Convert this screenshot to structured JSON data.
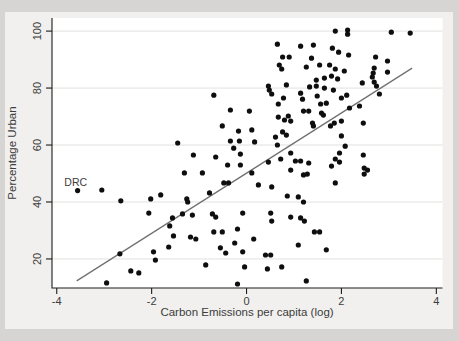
{
  "figure": {
    "outer_background": "#d6d5d3",
    "figure_background": "#f1f0ee",
    "plot_background": "#ffffff",
    "grid_color": "#e1e1df",
    "axis_color": "#1c1c1c",
    "text_color": "#3c3c3c",
    "dot_color": "#0e0e0e",
    "fit_line_color": "#6f6f6f"
  },
  "chart_data": {
    "type": "scatter",
    "title": "",
    "xlabel": "Carbon Emissions per capita (log)",
    "ylabel": "Percentage Urban",
    "xlim": [
      -4.1,
      4.13
    ],
    "ylim": [
      9.8,
      104.6
    ],
    "xticks": [
      "-4",
      "-2",
      "0",
      "2",
      "4"
    ],
    "xtick_values": [
      -4,
      -2,
      0,
      2,
      4
    ],
    "yticks": [
      "20",
      "40",
      "60",
      "80",
      "100"
    ],
    "ytick_values": [
      20,
      40,
      60,
      80,
      100
    ],
    "grid": "horizontal",
    "legend": "none",
    "annotation": {
      "label": "DRC",
      "x": -3.6,
      "y": 46.8
    },
    "fit_line": {
      "x1": -3.58,
      "y1": 12.3,
      "x2": 3.49,
      "y2": 87.0
    },
    "points": [
      [
        -1.45,
        60.7
      ],
      [
        0.65,
        95.4
      ],
      [
        1.14,
        94.7
      ],
      [
        0.76,
        90.9
      ],
      [
        0.9,
        90.9
      ],
      [
        0.74,
        86.7
      ],
      [
        1.26,
        87.4
      ],
      [
        1.41,
        95.1
      ],
      [
        0.69,
        88.1
      ],
      [
        1.37,
        90.5
      ],
      [
        0.46,
        80.7
      ],
      [
        0.48,
        79.3
      ],
      [
        0.53,
        77.9
      ],
      [
        0.84,
        81.1
      ],
      [
        -0.69,
        77.5
      ],
      [
        0.78,
        76.5
      ],
      [
        1.14,
        78.2
      ],
      [
        1.33,
        80.4
      ],
      [
        1.18,
        76.1
      ],
      [
        1.49,
        77.2
      ],
      [
        0.67,
        74.4
      ],
      [
        -0.34,
        72.3
      ],
      [
        0.06,
        71.9
      ],
      [
        0.67,
        69.8
      ],
      [
        0.88,
        70.2
      ],
      [
        0.93,
        68.4
      ],
      [
        1.31,
        71.9
      ],
      [
        1.2,
        71.9
      ],
      [
        1.39,
        67.7
      ],
      [
        1.41,
        66.7
      ],
      [
        0.8,
        68.8
      ],
      [
        -0.51,
        66.7
      ],
      [
        -0.17,
        64.9
      ],
      [
        0.11,
        65.3
      ],
      [
        -0.34,
        61.4
      ],
      [
        -0.15,
        61.4
      ],
      [
        0.17,
        61.1
      ],
      [
        0.61,
        62.8
      ],
      [
        0.84,
        63.5
      ],
      [
        0.76,
        64.6
      ],
      [
        0.65,
        60.0
      ],
      [
        -0.27,
        58.9
      ],
      [
        1.87,
        100.0
      ],
      [
        2.13,
        100.4
      ],
      [
        2.13,
        98.9
      ],
      [
        3.05,
        99.6
      ],
      [
        3.45,
        99.3
      ],
      [
        1.81,
        94.0
      ],
      [
        1.94,
        92.6
      ],
      [
        2.15,
        91.6
      ],
      [
        2.72,
        90.9
      ],
      [
        2.97,
        89.5
      ],
      [
        1.54,
        88.1
      ],
      [
        1.75,
        88.1
      ],
      [
        1.87,
        86.7
      ],
      [
        2.06,
        86.0
      ],
      [
        2.97,
        85.6
      ],
      [
        2.69,
        87.0
      ],
      [
        1.47,
        82.8
      ],
      [
        1.64,
        83.5
      ],
      [
        1.79,
        84.2
      ],
      [
        1.92,
        83.2
      ],
      [
        2.67,
        85.3
      ],
      [
        2.65,
        83.9
      ],
      [
        2.69,
        82.1
      ],
      [
        2.74,
        80.7
      ],
      [
        2.44,
        81.8
      ],
      [
        1.64,
        80.0
      ],
      [
        1.83,
        79.3
      ],
      [
        1.47,
        80.7
      ],
      [
        2.0,
        76.5
      ],
      [
        2.11,
        77.5
      ],
      [
        2.8,
        77.9
      ],
      [
        1.68,
        74.7
      ],
      [
        1.56,
        74.4
      ],
      [
        2.17,
        73.0
      ],
      [
        2.38,
        73.7
      ],
      [
        1.58,
        71.2
      ],
      [
        1.62,
        70.5
      ],
      [
        1.85,
        67.7
      ],
      [
        2.0,
        68.4
      ],
      [
        1.77,
        66.7
      ],
      [
        2.46,
        67.7
      ],
      [
        2.0,
        63.2
      ],
      [
        2.08,
        59.6
      ],
      [
        -3.56,
        44.0
      ],
      [
        -3.05,
        44.2
      ],
      [
        -2.65,
        40.4
      ],
      [
        -2.02,
        41.1
      ],
      [
        -1.81,
        42.5
      ],
      [
        -2.06,
        36.1
      ],
      [
        -1.56,
        34.4
      ],
      [
        -1.62,
        31.6
      ],
      [
        -1.54,
        28.1
      ],
      [
        -1.64,
        24.2
      ],
      [
        -1.96,
        22.5
      ],
      [
        -1.92,
        19.6
      ],
      [
        -2.67,
        21.8
      ],
      [
        -2.44,
        15.8
      ],
      [
        -2.27,
        15.1
      ],
      [
        -2.95,
        11.6
      ],
      [
        -1.12,
        56.5
      ],
      [
        -0.65,
        55.8
      ],
      [
        -0.13,
        56.8
      ],
      [
        0.93,
        57.2
      ],
      [
        0.46,
        54.0
      ],
      [
        0.72,
        55.1
      ],
      [
        1.03,
        54.4
      ],
      [
        1.14,
        54.4
      ],
      [
        1.31,
        53.7
      ],
      [
        -1.31,
        50.2
      ],
      [
        -0.93,
        50.2
      ],
      [
        -0.4,
        53.0
      ],
      [
        -0.13,
        53.0
      ],
      [
        0.11,
        50.2
      ],
      [
        0.93,
        51.2
      ],
      [
        1.2,
        49.5
      ],
      [
        1.28,
        49.8
      ],
      [
        -0.48,
        46.7
      ],
      [
        -0.38,
        46.7
      ],
      [
        0.25,
        46.0
      ],
      [
        0.53,
        45.3
      ],
      [
        0.86,
        42.1
      ],
      [
        1.09,
        41.8
      ],
      [
        1.2,
        40.0
      ],
      [
        -0.78,
        43.2
      ],
      [
        -1.26,
        41.1
      ],
      [
        -1.24,
        40.0
      ],
      [
        -1.35,
        35.8
      ],
      [
        -1.14,
        35.4
      ],
      [
        -0.72,
        35.8
      ],
      [
        -0.65,
        34.7
      ],
      [
        -0.08,
        36.1
      ],
      [
        0.51,
        36.1
      ],
      [
        0.53,
        33.3
      ],
      [
        0.93,
        34.7
      ],
      [
        1.14,
        34.4
      ],
      [
        1.22,
        33.3
      ],
      [
        -1.18,
        27.7
      ],
      [
        -1.07,
        27.0
      ],
      [
        -0.69,
        29.5
      ],
      [
        -0.51,
        29.5
      ],
      [
        -0.19,
        30.5
      ],
      [
        0.15,
        27.0
      ],
      [
        1.09,
        24.9
      ],
      [
        -0.55,
        23.9
      ],
      [
        -0.44,
        22.1
      ],
      [
        -0.25,
        25.6
      ],
      [
        -0.08,
        22.5
      ],
      [
        0.4,
        21.4
      ],
      [
        0.51,
        21.4
      ],
      [
        -0.86,
        17.9
      ],
      [
        -0.04,
        17.2
      ],
      [
        0.44,
        16.5
      ],
      [
        0.74,
        17.2
      ],
      [
        -0.19,
        11.2
      ],
      [
        1.26,
        12.3
      ],
      [
        1.96,
        57.2
      ],
      [
        1.87,
        55.1
      ],
      [
        1.96,
        54.0
      ],
      [
        1.79,
        52.6
      ],
      [
        2.46,
        56.5
      ],
      [
        2.48,
        51.9
      ],
      [
        2.55,
        51.2
      ],
      [
        2.48,
        49.8
      ],
      [
        1.87,
        46.7
      ],
      [
        1.43,
        29.5
      ],
      [
        1.54,
        29.5
      ],
      [
        1.68,
        23.2
      ]
    ]
  }
}
